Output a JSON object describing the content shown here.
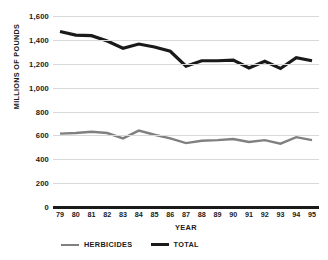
{
  "chart_data": {
    "type": "line",
    "title": "",
    "xlabel": "YEAR",
    "ylabel": "MILLIONS OF POUNDS",
    "categories": [
      "79",
      "80",
      "81",
      "82",
      "83",
      "84",
      "85",
      "86",
      "87",
      "88",
      "89",
      "90",
      "91",
      "92",
      "93",
      "94",
      "95"
    ],
    "ylim": [
      0,
      1600
    ],
    "ytick_values": [
      0,
      200,
      400,
      600,
      800,
      1000,
      1200,
      1400,
      1600
    ],
    "ytick_labels": [
      "0",
      "200",
      "400",
      "600",
      "800",
      "1,000",
      "1,200",
      "1,400",
      "1,600"
    ],
    "grid": true,
    "legend_position": "bottom-left",
    "series": [
      {
        "name": "HERBICIDES",
        "color": "#808080",
        "width": 2.4,
        "values": [
          615,
          620,
          630,
          620,
          575,
          640,
          605,
          575,
          535,
          555,
          560,
          570,
          545,
          560,
          530,
          585,
          560
        ]
      },
      {
        "name": "TOTAL",
        "color": "#1a1a1a",
        "width": 3.2,
        "values": [
          1470,
          1440,
          1435,
          1390,
          1330,
          1365,
          1340,
          1305,
          1180,
          1225,
          1225,
          1230,
          1165,
          1220,
          1160,
          1250,
          1225
        ]
      }
    ]
  },
  "legend": {
    "items": [
      {
        "label": "HERBICIDES",
        "color": "#808080",
        "width": 2.4
      },
      {
        "label": "TOTAL",
        "color": "#1a1a1a",
        "width": 3.2
      }
    ]
  },
  "axes": {
    "y_title": "MILLIONS OF POUNDS",
    "x_title": "YEAR"
  },
  "colors": {
    "gridline": "#d9d9d9",
    "axis": "#1a1a1a",
    "background": "#ffffff"
  }
}
